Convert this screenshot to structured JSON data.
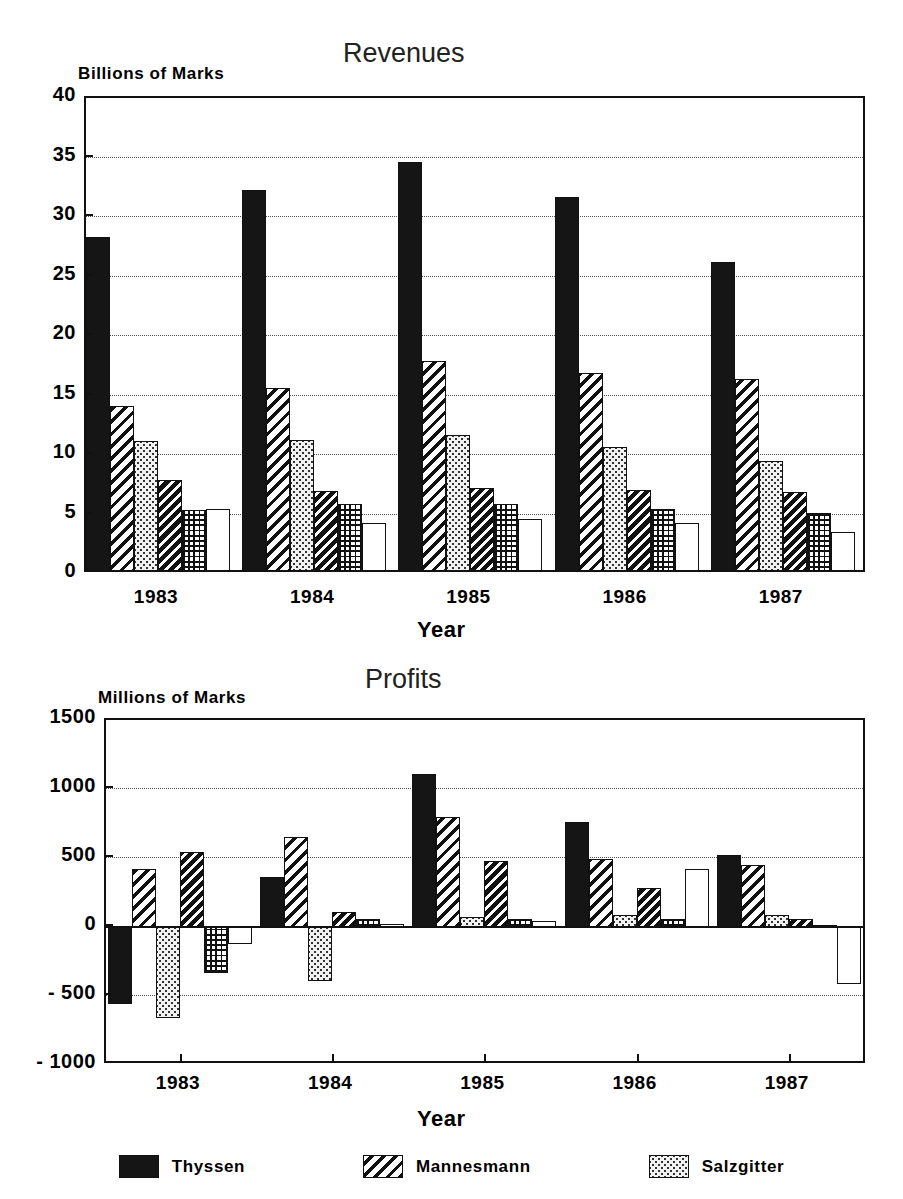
{
  "figure": {
    "background": "#ffffff",
    "ink": "#111111"
  },
  "charts": [
    {
      "key": "revenues",
      "title": "Revenues",
      "ylabel": "Billions of Marks",
      "xlabel": "Year"
    },
    {
      "key": "profits",
      "title": "Profits",
      "ylabel": "Millions of Marks",
      "xlabel": "Year"
    }
  ],
  "legend": {
    "position": "bottom-center",
    "items": [
      {
        "label": "Thyssen",
        "pattern": "solid-black"
      },
      {
        "label": "Mannesmann",
        "pattern": "diagonal-hatch"
      },
      {
        "label": "Salzgitter",
        "pattern": "light-dots"
      }
    ]
  },
  "chart_data": [
    {
      "type": "bar",
      "title": "Revenues",
      "xlabel": "Year",
      "ylabel": "Billions of Marks",
      "categories": [
        "1983",
        "1984",
        "1985",
        "1986",
        "1987"
      ],
      "ylim": [
        0,
        40
      ],
      "yticks": [
        0,
        5,
        10,
        15,
        20,
        25,
        30,
        35,
        40
      ],
      "ytick_labels": [
        "0",
        "5",
        "10",
        "15",
        "20",
        "25",
        "30",
        "35",
        "40"
      ],
      "grid": true,
      "grid_axis": "y",
      "legend_position": "bottom-center",
      "series": [
        {
          "name": "Thyssen",
          "pattern": "solid-black",
          "values": [
            28.3,
            32.3,
            34.6,
            31.7,
            26.2
          ]
        },
        {
          "name": "Mannesmann",
          "pattern": "diagonal-hatch",
          "values": [
            14.1,
            15.6,
            17.9,
            16.9,
            16.4
          ]
        },
        {
          "name": "Salzgitter",
          "pattern": "light-dots",
          "values": [
            11.2,
            11.3,
            11.7,
            10.7,
            9.5
          ]
        },
        {
          "name": "Series 4",
          "pattern": "dense-diagonal",
          "values": [
            7.9,
            7.0,
            7.2,
            7.1,
            6.9
          ]
        },
        {
          "name": "Series 5",
          "pattern": "cross-grid",
          "values": [
            5.4,
            5.9,
            5.9,
            5.5,
            5.1
          ]
        },
        {
          "name": "Series 6",
          "pattern": "white",
          "values": [
            5.5,
            4.3,
            4.6,
            4.3,
            3.5
          ]
        }
      ]
    },
    {
      "type": "bar",
      "title": "Profits",
      "xlabel": "Year",
      "ylabel": "Millions of Marks",
      "categories": [
        "1983",
        "1984",
        "1985",
        "1986",
        "1987"
      ],
      "ylim": [
        -1000,
        1500
      ],
      "yticks": [
        -1000,
        -500,
        0,
        500,
        1000,
        1500
      ],
      "ytick_labels": [
        "- 1000",
        "- 500",
        "0",
        "500",
        "1000",
        "1500"
      ],
      "grid": true,
      "grid_axis": "y",
      "legend_position": "bottom-center",
      "series": [
        {
          "name": "Thyssen",
          "pattern": "solid-black",
          "values": [
            -560,
            360,
            1110,
            760,
            520
          ]
        },
        {
          "name": "Mannesmann",
          "pattern": "diagonal-hatch",
          "values": [
            420,
            650,
            800,
            490,
            450
          ]
        },
        {
          "name": "Salzgitter",
          "pattern": "light-dots",
          "values": [
            -660,
            -390,
            75,
            90,
            85
          ]
        },
        {
          "name": "Series 4",
          "pattern": "dense-diagonal",
          "values": [
            540,
            110,
            480,
            280,
            55
          ]
        },
        {
          "name": "Series 5",
          "pattern": "cross-grid",
          "values": [
            -330,
            60,
            55,
            60,
            15
          ]
        },
        {
          "name": "Series 6",
          "pattern": "white",
          "values": [
            -120,
            20,
            45,
            420,
            -410
          ]
        }
      ]
    }
  ]
}
